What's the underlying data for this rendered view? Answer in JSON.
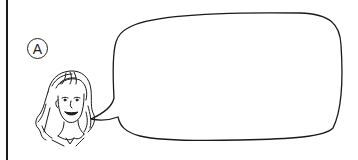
{
  "illustration": {
    "label": "A",
    "speech_bubble_text": "",
    "character": "girl with shoulder-length wavy hair, smiling",
    "colors": {
      "line": "#1a1a1a",
      "background": "#ffffff"
    }
  }
}
